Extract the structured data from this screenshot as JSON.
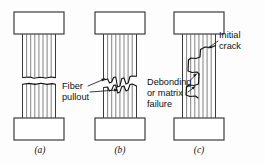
{
  "figure": {
    "background_color": "#fdfdfd",
    "line_color": "#2b2b2b",
    "fiber_color": "#5b5b5b",
    "width": 265,
    "height": 164
  },
  "specimens": [
    {
      "id": "a",
      "caption": "(a)",
      "failure_mode": "brittle-flat-fracture",
      "fiber_count": 8,
      "caption_x": 40,
      "caption_y": 153
    },
    {
      "id": "b",
      "caption": "(b)",
      "failure_mode": "fiber-pullout",
      "fiber_count": 8,
      "caption_x": 120,
      "caption_y": 153
    },
    {
      "id": "c",
      "caption": "(c)",
      "failure_mode": "debonding-matrix-failure",
      "fiber_count": 8,
      "caption_x": 199,
      "caption_y": 153
    }
  ],
  "annotations": [
    {
      "key": "fiber_pullout",
      "lines": [
        "Fiber",
        "pullout"
      ],
      "line1": "Fiber",
      "line2": "pullout",
      "text_x": 62,
      "text_y1": 87,
      "text_y2": 98,
      "target_specimen": "b"
    },
    {
      "key": "debonding",
      "lines": [
        "Debonding",
        "or matrix",
        "failure"
      ],
      "line1": "Debonding",
      "line2": "or matrix",
      "line3": "failure",
      "text_x": 147,
      "text_y1": 83,
      "text_y2": 94,
      "text_y3": 105,
      "target_specimen": "c"
    },
    {
      "key": "initial_crack",
      "lines": [
        "Initial",
        "crack"
      ],
      "line1": "Initial",
      "line2": "crack",
      "text_x": 219,
      "text_y1": 36,
      "text_y2": 47,
      "target_specimen": "c"
    }
  ]
}
